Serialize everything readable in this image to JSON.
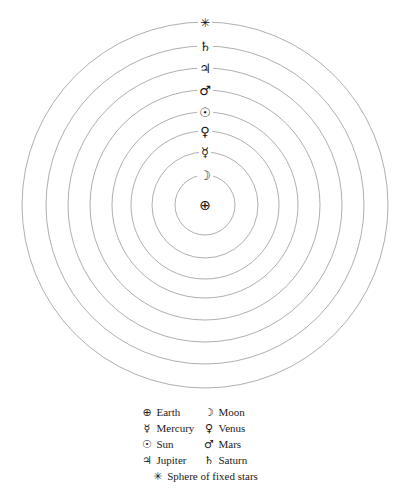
{
  "figure": {
    "center_x": 205,
    "center_y": 205,
    "line_color": "#8d8d8d",
    "background": "#ffffff",
    "text_color": "#1a1a1a"
  },
  "orbits": [
    {
      "id": "moon",
      "body": "Moon",
      "symbol": "☽",
      "symbol_name": "moon-crescent-symbol",
      "radius": 30,
      "order": 1
    },
    {
      "id": "mercury",
      "body": "Mercury",
      "symbol": "☿",
      "symbol_name": "mercury-symbol",
      "radius": 53,
      "order": 2
    },
    {
      "id": "venus",
      "body": "Venus",
      "symbol": "♀",
      "symbol_name": "venus-symbol",
      "radius": 74,
      "order": 3
    },
    {
      "id": "sun",
      "body": "Sun",
      "symbol": "☉",
      "symbol_name": "sun-symbol",
      "radius": 93,
      "order": 4
    },
    {
      "id": "mars",
      "body": "Mars",
      "symbol": "♂",
      "symbol_name": "mars-symbol",
      "radius": 115,
      "order": 5
    },
    {
      "id": "jupiter",
      "body": "Jupiter",
      "symbol": "♃",
      "symbol_name": "jupiter-symbol",
      "radius": 137,
      "order": 6
    },
    {
      "id": "saturn",
      "body": "Saturn",
      "symbol": "♄",
      "symbol_name": "saturn-symbol",
      "radius": 159,
      "order": 7
    },
    {
      "id": "stars",
      "body": "Sphere of fixed stars",
      "symbol": "✳",
      "symbol_name": "fixed-stars-symbol",
      "radius": 183,
      "order": 8
    }
  ],
  "center_body": {
    "id": "earth",
    "body": "Earth",
    "symbol": "⊕",
    "symbol_name": "earth-symbol"
  },
  "legend": {
    "rows": [
      {
        "left": {
          "symbol": "⊕",
          "label": "Earth",
          "symbol_name": "earth-symbol"
        },
        "right": {
          "symbol": "☽",
          "label": "Moon",
          "symbol_name": "moon-crescent-symbol"
        }
      },
      {
        "left": {
          "symbol": "☿",
          "label": "Mercury",
          "symbol_name": "mercury-symbol"
        },
        "right": {
          "symbol": "♀",
          "label": "Venus",
          "symbol_name": "venus-symbol"
        }
      },
      {
        "left": {
          "symbol": "☉",
          "label": "Sun",
          "symbol_name": "sun-symbol"
        },
        "right": {
          "symbol": "♂",
          "label": "Mars",
          "symbol_name": "mars-symbol"
        }
      },
      {
        "left": {
          "symbol": "♃",
          "label": "Jupiter",
          "symbol_name": "jupiter-symbol"
        },
        "right": {
          "symbol": "♄",
          "label": "Saturn",
          "symbol_name": "saturn-symbol"
        }
      }
    ],
    "wide_row": {
      "symbol": "✳",
      "label": "Sphere of fixed stars",
      "symbol_name": "fixed-stars-symbol"
    }
  }
}
